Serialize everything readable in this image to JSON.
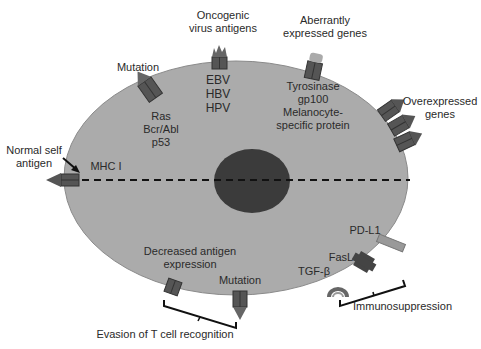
{
  "labels": {
    "oncogenic": [
      "Oncogenic",
      "virus antigens"
    ],
    "viruses": [
      "EBV",
      "HBV",
      "HPV"
    ],
    "aberrant": [
      "Aberrantly",
      "expressed genes"
    ],
    "aberrant_genes": [
      "Tyrosinase",
      "gp100",
      "Melanocyte-",
      "specific protein"
    ],
    "mutation_top": "Mutation",
    "mutation_genes": [
      "Ras",
      "Bcr/Abl",
      "p53"
    ],
    "overexpressed": [
      "Overexpressed",
      "genes"
    ],
    "normal_self": [
      "Normal self",
      "antigen"
    ],
    "mhc": "MHC I",
    "decreased": [
      "Decreased antigen",
      "expression"
    ],
    "mutation_bottom": "Mutation",
    "evasion": "Evasion of T cell recognition",
    "pdl1": "PD-L1",
    "fasl": "FasL",
    "tgfb": "TGF-β",
    "immunosuppression": "Immunosuppression"
  },
  "colors": {
    "cell": "#a9a9a9",
    "nucleus": "#3a3a3a",
    "receptor": "#555555",
    "pdl1": "#9a9a9a"
  }
}
